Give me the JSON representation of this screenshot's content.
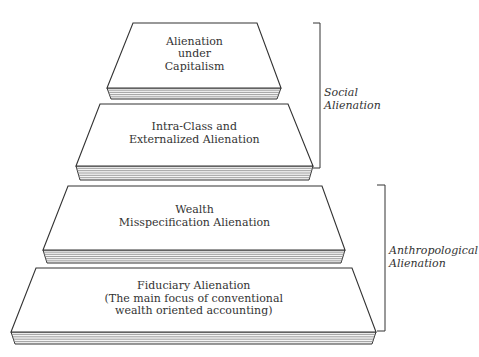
{
  "diagram": {
    "type": "stacked-pyramid-layers",
    "layers": [
      {
        "id": "capitalism",
        "lines": [
          "Alienation",
          "under",
          "Capitalism"
        ],
        "top_left": [
          133,
          23
        ],
        "top_right": [
          257,
          23
        ],
        "bottom_left": [
          107,
          88
        ],
        "bottom_right": [
          281,
          88
        ],
        "stack_bottom": 99
      },
      {
        "id": "intra-class",
        "lines": [
          "Intra-Class and",
          "Externalized Alienation"
        ],
        "top_left": [
          100,
          104
        ],
        "top_right": [
          288,
          104
        ],
        "bottom_left": [
          76,
          166
        ],
        "bottom_right": [
          313,
          166
        ],
        "stack_bottom": 180
      },
      {
        "id": "wealth-misspecification",
        "lines": [
          "Wealth",
          "Misspecification Alienation"
        ],
        "top_left": [
          68,
          186
        ],
        "top_right": [
          322,
          186
        ],
        "bottom_left": [
          43,
          250
        ],
        "bottom_right": [
          345,
          250
        ],
        "stack_bottom": 263
      },
      {
        "id": "fiduciary",
        "lines": [
          "Fiduciary Alienation",
          "(The main focus of conventional",
          "wealth oriented accounting)"
        ],
        "top_left": [
          36,
          268
        ],
        "top_right": [
          352,
          268
        ],
        "bottom_left": [
          11,
          332
        ],
        "bottom_right": [
          376,
          332
        ],
        "stack_bottom": 344
      }
    ],
    "brackets": [
      {
        "id": "social",
        "lines": [
          "Social",
          "Alienation"
        ],
        "x": 320,
        "y_top": 23,
        "y_bottom": 168,
        "tick_len": 7,
        "label_x": 324,
        "label_y": 86
      },
      {
        "id": "anthropological",
        "lines": [
          "Anthropological",
          "Alienation"
        ],
        "x": 385,
        "y_top": 185,
        "y_bottom": 331,
        "tick_len": 8,
        "label_x": 389,
        "label_y": 244
      }
    ],
    "colors": {
      "stroke": "#333333",
      "fill": "#ffffff",
      "page_lines": "#8a8a8a",
      "text": "#333333"
    }
  }
}
